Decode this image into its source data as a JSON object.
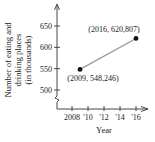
{
  "chart_data": {
    "type": "line",
    "title": "",
    "xlabel": "Year",
    "ylabel_lines": [
      "Number of eating and",
      "drinking places",
      "(in thousands)"
    ],
    "x_ticks": [
      2008,
      2010,
      2012,
      2014,
      2016
    ],
    "x_tick_labels": [
      "2008",
      "'10",
      "'12",
      "'14",
      "'16"
    ],
    "y_ticks": [
      500,
      550,
      600,
      650
    ],
    "y_tick_labels": [
      "500",
      "550",
      "600",
      "650"
    ],
    "xlim": [
      2006,
      2018
    ],
    "ylim": [
      440,
      680
    ],
    "y_axis_break": true,
    "grid": false,
    "series": [
      {
        "name": "eating and drinking places",
        "points": [
          {
            "x": 2009,
            "y": 548.246,
            "label": "(2009, 548,246)"
          },
          {
            "x": 2016,
            "y": 620.807,
            "label": "(2016, 620,807)"
          }
        ],
        "line_color": "#9a9a9a",
        "marker_color": "#111111"
      }
    ]
  }
}
